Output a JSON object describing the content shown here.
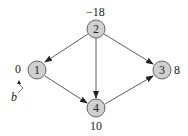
{
  "diagram": {
    "type": "directed-graph",
    "nodes": [
      {
        "id": "1",
        "label": "1",
        "value": "0"
      },
      {
        "id": "2",
        "label": "2",
        "value": "−18"
      },
      {
        "id": "3",
        "label": "3",
        "value": "8"
      },
      {
        "id": "4",
        "label": "4",
        "value": "10"
      }
    ],
    "edges": [
      {
        "from": "2",
        "to": "1"
      },
      {
        "from": "2",
        "to": "4"
      },
      {
        "from": "2",
        "to": "3"
      },
      {
        "from": "1",
        "to": "4"
      },
      {
        "from": "4",
        "to": "3"
      }
    ],
    "annotation": {
      "label": "b",
      "points_to": "0"
    },
    "colors": {
      "node_fill": "#d0d0d0",
      "node_stroke": "#444444",
      "edge": "#333333"
    }
  }
}
